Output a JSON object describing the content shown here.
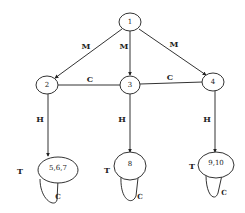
{
  "diagram": {
    "type": "state-graph",
    "nodes": [
      {
        "id": "n1",
        "label": "1"
      },
      {
        "id": "n2",
        "label": "2"
      },
      {
        "id": "n3",
        "label": "3"
      },
      {
        "id": "n4",
        "label": "4"
      },
      {
        "id": "n567",
        "label": "5,6,7"
      },
      {
        "id": "n8",
        "label": "8"
      },
      {
        "id": "n910",
        "label": "9,10"
      }
    ],
    "edges": [
      {
        "from": "n1",
        "to": "n2",
        "label": "M",
        "directed": true
      },
      {
        "from": "n1",
        "to": "n3",
        "label": "M",
        "directed": true
      },
      {
        "from": "n1",
        "to": "n4",
        "label": "M",
        "directed": true
      },
      {
        "from": "n2",
        "to": "n3",
        "label": "C",
        "directed": false
      },
      {
        "from": "n3",
        "to": "n4",
        "label": "C",
        "directed": false
      },
      {
        "from": "n2",
        "to": "n567",
        "label": "H",
        "directed": true
      },
      {
        "from": "n3",
        "to": "n8",
        "label": "H",
        "directed": true
      },
      {
        "from": "n4",
        "to": "n910",
        "label": "H",
        "directed": true
      },
      {
        "from": "n567",
        "to": "n567",
        "label": "C",
        "self_loop": true
      },
      {
        "from": "n8",
        "to": "n8",
        "label": "C",
        "self_loop": true
      },
      {
        "from": "n910",
        "to": "n910",
        "label": "C",
        "self_loop": true
      }
    ],
    "terminal_marks": [
      {
        "node": "n567",
        "label": "T"
      },
      {
        "node": "n8",
        "label": "T"
      },
      {
        "node": "n910",
        "label": "T"
      }
    ]
  }
}
